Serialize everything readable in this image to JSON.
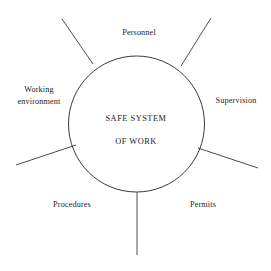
{
  "diagram": {
    "type": "hub-and-spoke",
    "title": "Safe System of Work",
    "center": {
      "line1": "SAFE SYSTEM",
      "line2": "OF WORK"
    },
    "colors": {
      "background": "#ffffff",
      "stroke": "#3a3a3a",
      "text": "#1c1c1c"
    },
    "circle": {
      "cx": 136.5,
      "cy": 124,
      "r": 68
    },
    "spokes": [
      {
        "name": "personnel",
        "label": "Personnel",
        "x1": 93,
        "y1": 64,
        "x2": 62,
        "y2": 19
      },
      {
        "name": "supervision",
        "label": "Supervision",
        "x1": 181,
        "y1": 66,
        "x2": 211,
        "y2": 18
      },
      {
        "name": "working-environment",
        "label": "Working\nenvironment",
        "x1": 76,
        "y1": 145,
        "x2": 16,
        "y2": 165
      },
      {
        "name": "permits",
        "label": "Permits",
        "x1": 198,
        "y1": 148,
        "x2": 258,
        "y2": 168
      },
      {
        "name": "procedures",
        "label": "Procedures",
        "x1": 137,
        "y1": 192,
        "x2": 137,
        "y2": 255
      }
    ],
    "labels": {
      "personnel": "Personnel",
      "supervision": "Supervision",
      "permits": "Permits",
      "procedures": "Procedures",
      "working_environment": "Working\nenvironment"
    }
  }
}
